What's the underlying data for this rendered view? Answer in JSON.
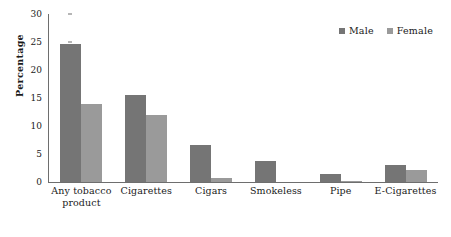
{
  "chart_data": {
    "type": "bar",
    "title": "",
    "subtitle": "",
    "xlabel": "",
    "ylabel": "Percentage",
    "ylim": [
      0,
      30
    ],
    "ytick_values": [
      30,
      25,
      20,
      15,
      10,
      5,
      0
    ],
    "ytick_labels": [
      "30",
      "25",
      "20",
      "15",
      "10",
      "5",
      "0"
    ],
    "grid": false,
    "legend_position": "top-right",
    "categories": [
      "Any tobacco product",
      "Cigarettes",
      "Cigars",
      "Smokeless",
      "Pipe",
      "E-Cigarettes"
    ],
    "category_lines": [
      [
        "Any tobacco",
        "product"
      ],
      [
        "Cigarettes"
      ],
      [
        "Cigars"
      ],
      [
        "Smokeless"
      ],
      [
        "Pipe"
      ],
      [
        "E-Cigarettes"
      ]
    ],
    "series": [
      {
        "name": "Male",
        "color": "#757575",
        "values": [
          24.6,
          15.6,
          6.6,
          3.8,
          1.5,
          3.0
        ]
      },
      {
        "name": "Female",
        "color": "#9a9a9a",
        "values": [
          14.0,
          12.0,
          0.8,
          0.0,
          0.2,
          2.1
        ]
      }
    ]
  },
  "legend": {
    "entries": [
      {
        "label": "Male",
        "color": "#757575"
      },
      {
        "label": "Female",
        "color": "#9a9a9a"
      }
    ]
  },
  "axis": {
    "y_label": "Percentage"
  },
  "colors": {
    "male": "#757575",
    "female": "#9a9a9a",
    "axis": "#6e6e6e",
    "background": "#ffffff",
    "text": "#1a1a1a"
  }
}
